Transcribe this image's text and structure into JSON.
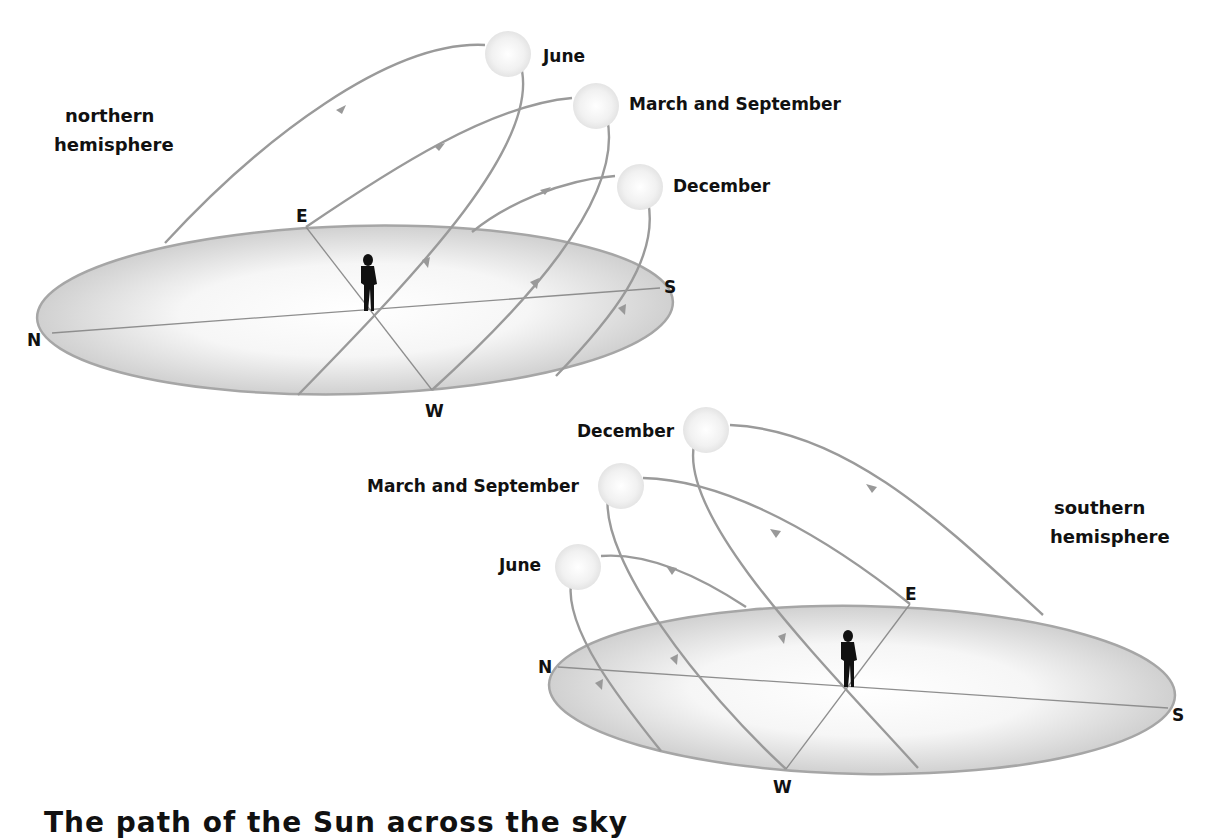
{
  "northern": {
    "title_line1": "northern",
    "title_line2": "hemisphere",
    "directions": {
      "n": "N",
      "e": "E",
      "s": "S",
      "w": "W"
    },
    "suns": [
      {
        "label": "June"
      },
      {
        "label": "March and September"
      },
      {
        "label": "December"
      }
    ]
  },
  "southern": {
    "title_line1": "southern",
    "title_line2": "hemisphere",
    "directions": {
      "n": "N",
      "e": "E",
      "s": "S",
      "w": "W"
    },
    "suns": [
      {
        "label": "December"
      },
      {
        "label": "March and September"
      },
      {
        "label": "June"
      }
    ]
  },
  "caption": "The path of the Sun across the sky"
}
